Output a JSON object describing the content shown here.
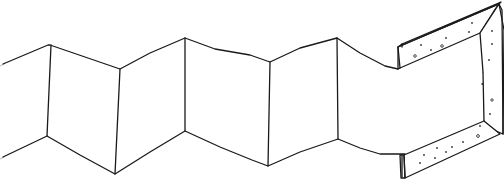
{
  "illustration": {
    "title": "Folding accordion screen with perforated end frame",
    "style": "black line drawing on white",
    "colors": {
      "ink": "#1a1a1a",
      "background": "#ffffff",
      "faint_edge": "#c8c8c8"
    },
    "panels": 6,
    "fold_lines": [
      {
        "top": [
          50,
          45
        ],
        "bottom": [
          47,
          136
        ]
      },
      {
        "top": [
          120,
          69
        ],
        "bottom": [
          115,
          174
        ]
      },
      {
        "top": [
          185,
          38
        ],
        "bottom": [
          185,
          131
        ]
      },
      {
        "top": [
          270,
          62
        ],
        "bottom": [
          268,
          166
        ]
      },
      {
        "top": [
          337,
          38
        ],
        "bottom": [
          338,
          139
        ]
      }
    ],
    "components": [
      "accordion-panels",
      "rectangular-frame",
      "strap"
    ]
  }
}
